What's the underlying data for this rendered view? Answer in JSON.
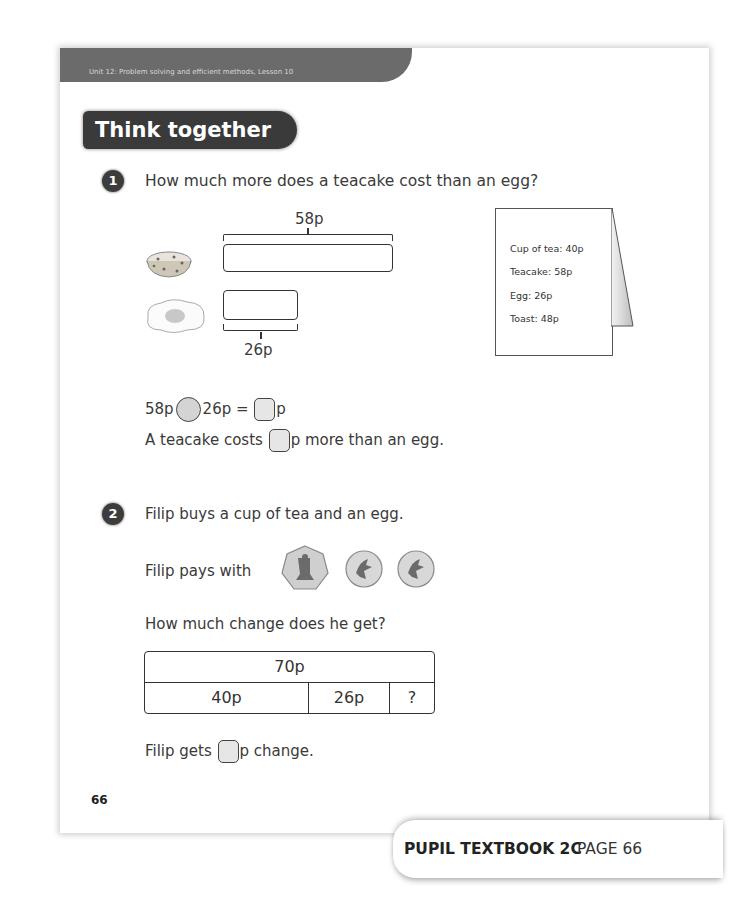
{
  "header": {
    "unit_label": "Unit 12: Problem solving and efficient methods, Lesson 10",
    "section_title": "Think together"
  },
  "q1": {
    "number": "1",
    "question": "How much more does a teacake cost than an egg?",
    "bar_model": {
      "top_label": "58p",
      "bottom_label": "26p",
      "top_item_icon": "teacake-icon",
      "bottom_item_icon": "egg-icon"
    },
    "menu": {
      "items": [
        "Cup of tea: 40p",
        "Teacake: 58p",
        "Egg: 26p",
        "Toast: 48p"
      ]
    },
    "equation": {
      "left": "58p",
      "right": "26p =",
      "unit": "p"
    },
    "sentence": {
      "before": "A teacake costs",
      "after": "p more than an egg."
    }
  },
  "q2": {
    "number": "2",
    "question": "Filip buys a cup of tea and an egg.",
    "pays_label": "Filip pays with",
    "coins": [
      "50p",
      "10p",
      "10p"
    ],
    "change_question": "How much change does he get?",
    "bar_model": {
      "total": "70p",
      "parts": [
        "40p",
        "26p",
        "?"
      ]
    },
    "sentence": {
      "before": "Filip gets",
      "after": "p change."
    }
  },
  "page_number": "66",
  "footer": {
    "book": "PUPIL TEXTBOOK 2C",
    "page": "PAGE 66"
  }
}
